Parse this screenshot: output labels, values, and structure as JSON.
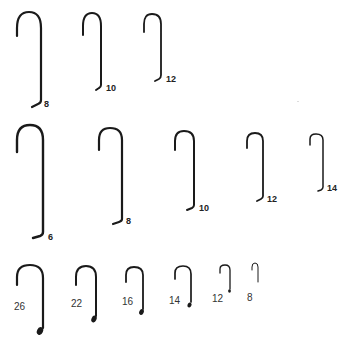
{
  "figure": {
    "background": "#ffffff",
    "ink_color": "#1a1a1a"
  },
  "rows": [
    {
      "name": "top-row",
      "style": "long-shank, bold labels right of bend",
      "hooks": [
        {
          "size": "8"
        },
        {
          "size": "10"
        },
        {
          "size": "12"
        }
      ]
    },
    {
      "name": "middle-row",
      "style": "extra-long-shank, bold labels right of bend",
      "hooks": [
        {
          "size": "6"
        },
        {
          "size": "8"
        },
        {
          "size": "10"
        },
        {
          "size": "12"
        },
        {
          "size": "14"
        }
      ]
    },
    {
      "name": "bottom-row",
      "style": "short-shank with eye, labels left of shank",
      "hooks": [
        {
          "size": "26"
        },
        {
          "size": "22"
        },
        {
          "size": "16"
        },
        {
          "size": "14"
        },
        {
          "size": "12"
        },
        {
          "size": "8"
        }
      ]
    }
  ]
}
